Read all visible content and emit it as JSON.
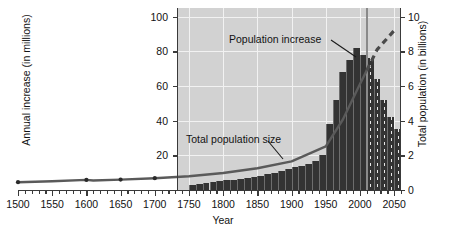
{
  "chart_data": {
    "type": "bar",
    "title": "",
    "xlabel": "Year",
    "ylabel": "Annual increase (in millions)",
    "ylabel_right": "Total population (in billions)",
    "xlim": [
      1500,
      2060
    ],
    "ylim": [
      0,
      105
    ],
    "ylim_right": [
      0,
      10.5
    ],
    "grid": true,
    "legend_position": "none",
    "xticks": [
      1500,
      1550,
      1600,
      1650,
      1700,
      1750,
      1800,
      1850,
      1900,
      1950,
      2000,
      2050
    ],
    "xtick_labels": [
      "1500",
      "1550",
      "1600",
      "1650",
      "1700",
      "1750",
      "1800",
      "1850",
      "1900",
      "1950",
      "2000",
      "2050"
    ],
    "yticks_left": [
      20,
      40,
      60,
      80,
      100
    ],
    "ytick_labels_left": [
      "20",
      "40",
      "60",
      "80",
      "100"
    ],
    "yticks_right": [
      0,
      2,
      4,
      6,
      8,
      10
    ],
    "ytick_labels_right": [
      "0",
      "2",
      "4",
      "6",
      "8",
      "10"
    ],
    "minor_tick_interval": 10,
    "panel_x_start": 1750,
    "present_day_year": 2010,
    "annotations": [
      {
        "text": "Population increase",
        "x": 1860,
        "y": 88,
        "points_to": "bars"
      },
      {
        "text": "Total population size",
        "x": 1790,
        "y": 30,
        "points_to": "population-curve"
      }
    ],
    "series": [
      {
        "name": "Population increase",
        "type": "bar",
        "axis": "left",
        "unit": "millions per year",
        "categories": [
          1750,
          1760,
          1770,
          1780,
          1790,
          1800,
          1810,
          1820,
          1830,
          1840,
          1850,
          1860,
          1870,
          1880,
          1890,
          1900,
          1910,
          1920,
          1930,
          1940,
          1950,
          1960,
          1970,
          1980,
          1990,
          2000,
          2010,
          2020,
          2030,
          2040,
          2050
        ],
        "values": [
          3,
          3.5,
          4,
          4.5,
          5,
          5.5,
          6,
          6.5,
          7,
          7.5,
          8,
          9,
          10,
          11,
          12,
          13,
          14,
          15,
          17,
          20,
          38,
          52,
          68,
          75,
          82,
          78,
          76,
          64,
          52,
          42,
          35
        ],
        "projected_from": 2010
      },
      {
        "name": "Total population size",
        "type": "line",
        "axis": "right",
        "unit": "billions",
        "x": [
          1500,
          1550,
          1600,
          1610,
          1650,
          1700,
          1750,
          1800,
          1850,
          1900,
          1950,
          1975,
          2000,
          2010,
          2025,
          2050
        ],
        "values": [
          0.45,
          0.5,
          0.58,
          0.55,
          0.6,
          0.68,
          0.79,
          0.98,
          1.26,
          1.65,
          2.52,
          4.07,
          6.12,
          6.9,
          8.1,
          9.2
        ],
        "dashed_from": 2010,
        "data_points_marked": [
          1500,
          1600,
          1650,
          1700
        ]
      }
    ]
  },
  "axis": {
    "left_title": "Annual increase (in millions)",
    "right_title": "Total population (in billions)",
    "bottom_title": "Year"
  },
  "annotations": {
    "population_increase": "Population increase",
    "total_population_size": "Total population size"
  },
  "colors": {
    "panel": "#d2d2d2",
    "gridline": "#f2f2f2",
    "bar": "#333333",
    "curve": "#5a5a5a",
    "present_line": "#8a8a8a",
    "text": "#121212",
    "background": "#ffffff"
  }
}
